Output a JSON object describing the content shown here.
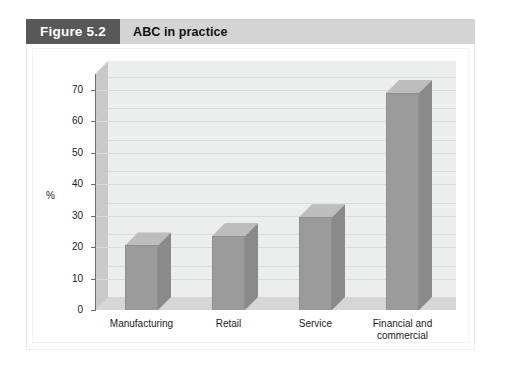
{
  "figure": {
    "badge_label": "Figure 5.2",
    "title": "ABC in practice"
  },
  "chart_data": {
    "type": "bar",
    "title": "ABC in practice",
    "categories": [
      "Manufacturing",
      "Retail",
      "Service",
      "Financial and\ncommercial"
    ],
    "values": [
      20.5,
      23.5,
      29.5,
      69
    ],
    "xlabel": "",
    "ylabel": "%",
    "ylim": [
      0,
      75
    ],
    "yticks": [
      0,
      10,
      20,
      30,
      40,
      50,
      60,
      70
    ],
    "ytick_labels": [
      "0",
      "10",
      "20",
      "30",
      "40",
      "50",
      "60",
      "70"
    ],
    "grid": true,
    "legend": false,
    "style": "3d-column",
    "colors": {
      "bar_front": "#9b9b9b",
      "bar_side": "#8a8a8a",
      "bar_top": "#bdbdbd",
      "plot_back_wall": "#eceded",
      "plot_left_wall": "#c9c9c9",
      "plot_floor": "#d6d6d6",
      "gridline": "#d9dada",
      "axis": "#6e6e6e",
      "badge_bg": "#585858",
      "header_bg": "#d4d4d4",
      "text": "#1c1c1c"
    }
  }
}
